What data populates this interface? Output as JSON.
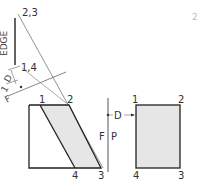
{
  "colors": {
    "line": "#222222",
    "thin_line": "#666666",
    "fill": "#e6e6e6",
    "text": "#333333"
  },
  "labels": {
    "edge_view_points": "2,3",
    "edge_view_points_b": "1,4",
    "edge": "EDGE",
    "dimension": "D",
    "fold_f": "F",
    "fold_p": "P",
    "fold_f_aux": "F",
    "fold_aux_1": "1",
    "front_points": [
      "1",
      "2",
      "4",
      "3"
    ],
    "profile_points": [
      "1",
      "2",
      "4",
      "3"
    ],
    "profile_dimension": "D",
    "corner_fragment": "2"
  }
}
